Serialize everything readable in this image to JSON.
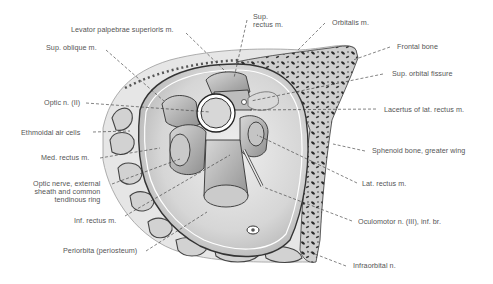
{
  "figure": {
    "colors": {
      "background": "#ffffff",
      "label_text": "#555555",
      "leader_line": "#333333",
      "bone_dark": "#2a2a2a",
      "bone_light": "#cfcfcf",
      "orbit_fill": "#dcdcdc",
      "muscle": "#bdbdbd"
    }
  },
  "labels": {
    "levator": "Levator palpebrae superioris m.",
    "sup_rectus": "Sup.\nrectus m.",
    "orbitalis": "Orbitalis m.",
    "frontal_bone": "Frontal bone",
    "sup_oblique": "Sup. oblique m.",
    "sup_orbital_fissure": "Sup. orbital fissure",
    "optic_n": "Optic n. (II)",
    "lacertus": "Lacertus of lat. rectus m.",
    "ethmoidal": "Ethmoidal air cells",
    "med_rectus": "Med. rectus m.",
    "sphenoid": "Sphenoid bone, greater wing",
    "optic_nerve_sheath": "Optic nerve, external\nsheath and common\ntendinous ring",
    "lat_rectus": "Lat. rectus m.",
    "inf_rectus": "Inf. rectus m.",
    "oculomotor": "Oculomotor n. (III), inf. br.",
    "periorbita": "Periorbita (periosteum)",
    "infraorbital": "Infraorbital n."
  }
}
